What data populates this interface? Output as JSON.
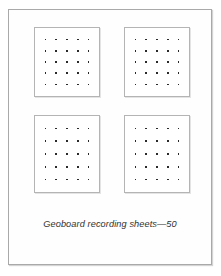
{
  "page": {
    "background_color": "#ffffff",
    "sheet_border_color": "#a9a9a9",
    "sheet_background_color": "#fefefe"
  },
  "worksheet": {
    "title": "Geoboard recording sheets—50",
    "caption": "Geoboard recording sheets—50",
    "caption_style": "italic",
    "page_number": "50",
    "label_text": "Geoboard recording sheets",
    "separator": "—"
  },
  "grids": {
    "count": 4,
    "layout": "2x2",
    "rows_of_dots": 5,
    "cols_of_dots": 5,
    "dots_per_grid": 25,
    "dot_color": "#2a2a2a",
    "border_color": "#b4b4b4",
    "items": [
      {
        "id": "geoboard-top-left",
        "position": "top-left",
        "rows": 5,
        "cols": 5,
        "dots": 25
      },
      {
        "id": "geoboard-top-right",
        "position": "top-right",
        "rows": 5,
        "cols": 5,
        "dots": 25
      },
      {
        "id": "geoboard-bottom-left",
        "position": "bottom-left",
        "rows": 5,
        "cols": 5,
        "dots": 25
      },
      {
        "id": "geoboard-bottom-right",
        "position": "bottom-right",
        "rows": 5,
        "cols": 5,
        "dots": 25
      }
    ]
  }
}
